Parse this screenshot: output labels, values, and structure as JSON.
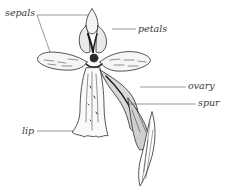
{
  "diagram": {
    "colors": {
      "ink": "#2b2b2b",
      "label": "#3a3a3a",
      "background": "#ffffff"
    },
    "labels": [
      {
        "id": "sepals",
        "text": "sepals"
      },
      {
        "id": "petals",
        "text": "petals"
      },
      {
        "id": "ovary",
        "text": "ovary"
      },
      {
        "id": "spur",
        "text": "spur"
      },
      {
        "id": "lip",
        "text": "lip"
      }
    ]
  }
}
